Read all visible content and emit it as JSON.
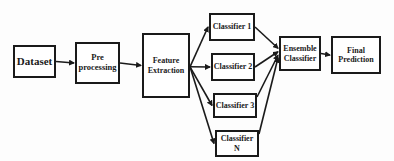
{
  "diagram": {
    "type": "flowchart",
    "nodes": {
      "dataset": "Dataset",
      "preprocessing": [
        "Pre",
        "processing"
      ],
      "feature_extraction": [
        "Feature",
        "Extraction"
      ],
      "classifier_1": "Classifier 1",
      "classifier_2": "Classifier 2",
      "classifier_3": "Classifier 3",
      "classifier_n": "Classifier N",
      "ensemble": [
        "Ensemble",
        "Classifier"
      ],
      "final_prediction": [
        "Final",
        "Prediction"
      ]
    },
    "edges": [
      [
        "dataset",
        "preprocessing"
      ],
      [
        "preprocessing",
        "feature_extraction"
      ],
      [
        "feature_extraction",
        "classifier_1"
      ],
      [
        "feature_extraction",
        "classifier_2"
      ],
      [
        "feature_extraction",
        "classifier_3"
      ],
      [
        "feature_extraction",
        "classifier_n"
      ],
      [
        "classifier_1",
        "ensemble"
      ],
      [
        "classifier_2",
        "ensemble"
      ],
      [
        "classifier_3",
        "ensemble"
      ],
      [
        "classifier_n",
        "ensemble"
      ],
      [
        "ensemble",
        "final_prediction"
      ]
    ],
    "colors": {
      "stroke": "#1a1a1a",
      "background": "#ffffff"
    }
  }
}
